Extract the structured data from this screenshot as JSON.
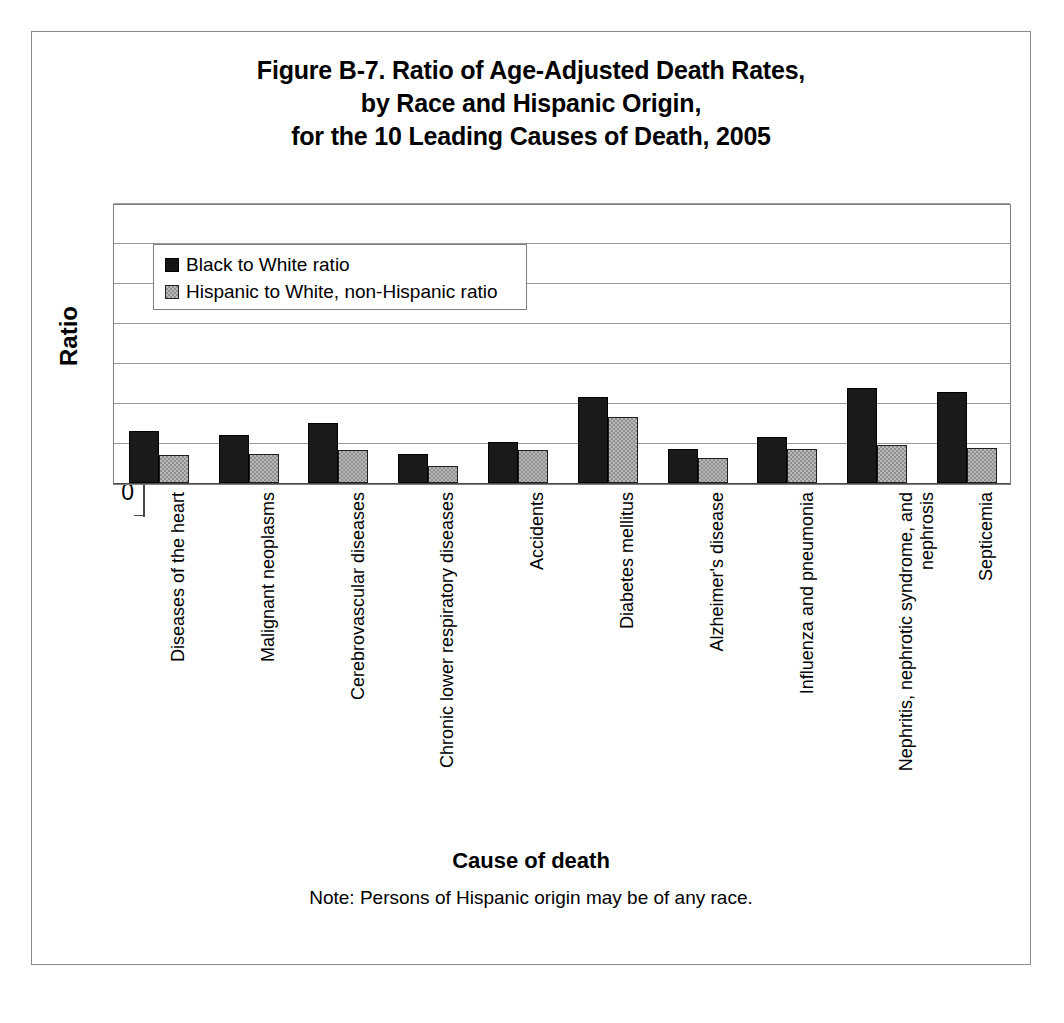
{
  "chart_data": {
    "type": "bar",
    "title": "Figure B-7. Ratio of Age-Adjusted Death Rates, by Race and Hispanic Origin, for the 10 Leading Causes of Death, 2005",
    "title_lines": [
      "Figure B-7. Ratio of Age-Adjusted Death Rates,",
      "by Race and Hispanic Origin,",
      "for the 10 Leading Causes of Death, 2005"
    ],
    "xlabel": "Cause of death",
    "ylabel": "Ratio",
    "ylim": [
      0,
      7
    ],
    "yticks": [
      0,
      1,
      2,
      3,
      4,
      5,
      6,
      7
    ],
    "ytick_labels": [
      "0",
      "1",
      "2",
      "3",
      "4",
      "5",
      "6",
      "7"
    ],
    "grid": "horizontal",
    "legend_position": "top-left-inside",
    "note": "Note: Persons of Hispanic origin may be of any race.",
    "categories": [
      "Diseases of the heart",
      "Malignant neoplasms",
      "Cerebrovascular diseases",
      "Chronic lower respiratory diseases",
      "Accidents",
      "Diabetes mellitus",
      "Alzheimer's disease",
      "Influenza and pneumonia",
      "Nephritis, nephrotic syndrome, and nephrosis",
      "Septicemia"
    ],
    "series": [
      {
        "name": "Black to White ratio",
        "color": "#1a1a1a",
        "values": [
          1.3,
          1.21,
          1.51,
          0.72,
          1.03,
          2.15,
          0.86,
          1.15,
          2.37,
          2.27
        ]
      },
      {
        "name": "Hispanic to White, non-Hispanic ratio",
        "color": "#b9b9b9",
        "values": [
          0.7,
          0.72,
          0.82,
          0.42,
          0.83,
          1.65,
          0.63,
          0.85,
          0.95,
          0.88
        ]
      }
    ]
  },
  "legend": {
    "items": [
      {
        "label": "Black to White ratio",
        "swatch": "black-swatch"
      },
      {
        "label": "Hispanic to White, non-Hispanic ratio",
        "swatch": "gray-swatch"
      }
    ]
  },
  "colors": {
    "black_series": "#1a1a1a",
    "gray_series": "#b9b9b9",
    "gridline": "#9a9a9a",
    "frame": "#8a8a8a",
    "background": "#ffffff"
  }
}
